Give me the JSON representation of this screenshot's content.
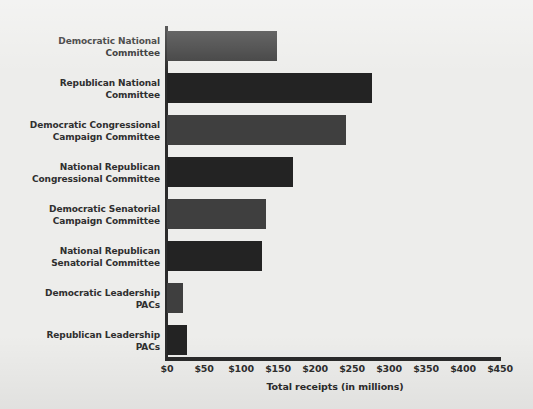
{
  "chart_data": {
    "type": "bar",
    "orientation": "horizontal",
    "title": "",
    "xlabel": "Total receipts (in millions)",
    "ylabel": "",
    "xlim": [
      0,
      450
    ],
    "xticks": [
      "$0",
      "$50",
      "$100",
      "$150",
      "$200",
      "$250",
      "$300",
      "$350",
      "$400",
      "$450"
    ],
    "xtick_values": [
      0,
      50,
      100,
      150,
      200,
      250,
      300,
      350,
      400,
      450
    ],
    "grid": false,
    "legend": "none",
    "categories": [
      "Democratic National Committee",
      "Republican National Committee",
      "Democratic Congressional Campaign Committee",
      "National Republican Congressional Committee",
      "Democratic Senatorial Campaign Committee",
      "National Republican Senatorial Committee",
      "Democratic Leadership PACs",
      "Republican Leadership PACs"
    ],
    "values": [
      149,
      277,
      242,
      170,
      134,
      128,
      21,
      27
    ],
    "series": [
      {
        "name": "Total receipts (in millions)",
        "values": [
          149,
          277,
          242,
          170,
          134,
          128,
          21,
          27
        ]
      }
    ],
    "bars": [
      {
        "label_line1": "Democratic National",
        "label_line2": "Committee",
        "value": 149,
        "party": "dem"
      },
      {
        "label_line1": "Republican National",
        "label_line2": "Committee",
        "value": 277,
        "party": "rep"
      },
      {
        "label_line1": "Democratic Congressional",
        "label_line2": "Campaign Committee",
        "value": 242,
        "party": "dem"
      },
      {
        "label_line1": "National Republican",
        "label_line2": "Congressional Committee",
        "value": 170,
        "party": "rep"
      },
      {
        "label_line1": "Democratic Senatorial",
        "label_line2": "Campaign Committee",
        "value": 134,
        "party": "dem"
      },
      {
        "label_line1": "National Republican",
        "label_line2": "Senatorial Committee",
        "value": 128,
        "party": "rep"
      },
      {
        "label_line1": "Democratic Leadership",
        "label_line2": "PACs",
        "value": 21,
        "party": "dem"
      },
      {
        "label_line1": "Republican Leadership",
        "label_line2": "PACs",
        "value": 27,
        "party": "rep"
      }
    ],
    "colors": {
      "democratic_bar": "#3f3f3f",
      "republican_bar": "#232323",
      "axis": "#2b2b2b",
      "background": "#ededeb",
      "text": "#2f2f2f"
    }
  }
}
